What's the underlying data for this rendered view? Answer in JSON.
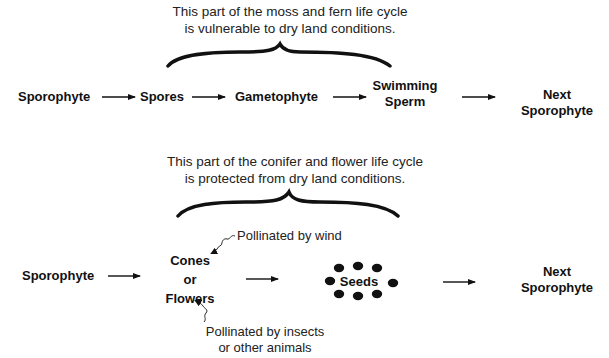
{
  "top_diagram": {
    "caption_line1": "This part of the moss and fern life cycle",
    "caption_line2": "is vulnerable to dry land conditions.",
    "nodes": [
      {
        "label": "Sporophyte"
      },
      {
        "label": "Spores"
      },
      {
        "label": "Gametophyte"
      },
      {
        "label_line1": "Swimming",
        "label_line2": "Sperm"
      },
      {
        "label_line1": "Next",
        "label_line2": "Sporophyte"
      }
    ]
  },
  "bottom_diagram": {
    "caption_line1": "This part of the conifer and flower life cycle",
    "caption_line2": "is protected from dry land conditions.",
    "nodes": [
      {
        "label": "Sporophyte"
      },
      {
        "label_line1": "Cones",
        "label_line2": "or",
        "label_line3": "Flowers"
      },
      {
        "label": "Seeds"
      },
      {
        "label_line1": "Next",
        "label_line2": "Sporophyte"
      }
    ],
    "annotations": {
      "wind": "Pollinated by wind",
      "animals_line1": "Pollinated by insects",
      "animals_line2": "or other animals"
    }
  },
  "colors": {
    "ink": "#111111",
    "background": "#ffffff"
  }
}
